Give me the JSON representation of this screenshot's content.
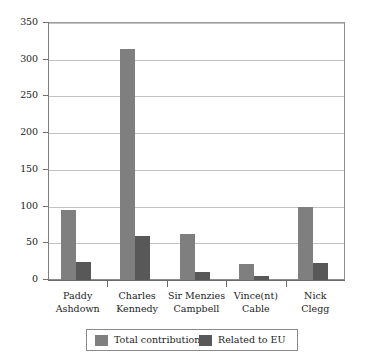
{
  "chart_data": {
    "type": "bar",
    "title": "",
    "subtitle": "",
    "xlabel": "",
    "ylabel": "",
    "categories": [
      "Paddy Ashdown",
      "Charles Kennedy",
      "Sir Menzies Campbell",
      "Vince(nt) Cable",
      "Nick Clegg"
    ],
    "category_lines": [
      [
        "Paddy",
        "Ashdown"
      ],
      [
        "Charles",
        "Kennedy"
      ],
      [
        "Sir Menzies",
        "Campbell"
      ],
      [
        "Vince(nt)",
        "Cable"
      ],
      [
        "Nick",
        "Clegg"
      ]
    ],
    "series": [
      {
        "name": "Total contributions",
        "color": "#7f7f7f",
        "values": [
          95,
          315,
          63,
          22,
          100
        ]
      },
      {
        "name": "Related to EU",
        "color": "#585858",
        "values": [
          25,
          60,
          11,
          5,
          23
        ]
      }
    ],
    "ylim": [
      0,
      350
    ],
    "ytick_values": [
      0,
      50,
      100,
      150,
      200,
      250,
      300,
      350
    ],
    "ytick_labels": [
      "0",
      "50",
      "100",
      "150",
      "200",
      "250",
      "300",
      "350"
    ],
    "grid": true,
    "gridline_color": "#c3c3c3",
    "legend_position": "bottom",
    "plot_background": "#ffffff",
    "frame_color": "#8d8d8d"
  }
}
